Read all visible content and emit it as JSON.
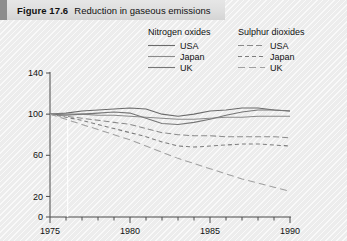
{
  "figure": {
    "number": "Figure 17.6",
    "title": "Reduction in gaseous emissions"
  },
  "legend": {
    "groups": [
      {
        "heading": "Nitrogen oxides",
        "style": "solid",
        "entries": [
          {
            "label": "USA",
            "dash": "none"
          },
          {
            "label": "Japan",
            "dash": "none"
          },
          {
            "label": "UK",
            "dash": "none"
          }
        ]
      },
      {
        "heading": "Sulphur dioxides",
        "style": "dashed",
        "entries": [
          {
            "label": "USA",
            "dash": "6 3"
          },
          {
            "label": "Japan",
            "dash": "4 3"
          },
          {
            "label": "UK",
            "dash": "7 4"
          }
        ]
      }
    ]
  },
  "chart_data": {
    "type": "line",
    "title": "Reduction in gaseous emissions",
    "xlabel": "",
    "ylabel": "",
    "xlim": [
      1975,
      1990
    ],
    "ylim": [
      0,
      140
    ],
    "xticks": [
      1975,
      1980,
      1985,
      1990
    ],
    "xticklabels": [
      "1975",
      "1980",
      "1985",
      "1990"
    ],
    "xminor_step": 1,
    "yticks": [
      0,
      20,
      60,
      100,
      140
    ],
    "yticklabels": [
      "0",
      "20",
      "60",
      "100",
      "140"
    ],
    "grid": false,
    "index_base": "1975 = 100",
    "x": [
      1975,
      1976,
      1977,
      1978,
      1979,
      1980,
      1981,
      1982,
      1983,
      1984,
      1985,
      1986,
      1987,
      1988,
      1989,
      1990
    ],
    "series": [
      {
        "name": "Nitrogen oxides USA",
        "group": "Nitrogen oxides",
        "country": "USA",
        "dash": "none",
        "color": "#6b6b6b",
        "values": [
          100,
          101,
          103,
          104,
          105,
          106,
          105,
          100,
          98,
          100,
          103,
          104,
          106,
          106,
          104,
          103
        ]
      },
      {
        "name": "Nitrogen oxides Japan",
        "group": "Nitrogen oxides",
        "country": "Japan",
        "dash": "none",
        "color": "#8a8a8a",
        "values": [
          100,
          100,
          100,
          99,
          99,
          98,
          97,
          96,
          95,
          95,
          96,
          97,
          97,
          98,
          98,
          98
        ]
      },
      {
        "name": "Nitrogen oxides UK",
        "group": "Nitrogen oxides",
        "country": "UK",
        "dash": "none",
        "color": "#767676",
        "values": [
          100,
          99,
          100,
          101,
          102,
          101,
          96,
          91,
          90,
          92,
          95,
          99,
          102,
          104,
          104,
          103
        ]
      },
      {
        "name": "Sulphur dioxides USA",
        "group": "Sulphur dioxides",
        "country": "USA",
        "dash": "6 3",
        "color": "#8a8a8a",
        "values": [
          100,
          98,
          96,
          94,
          92,
          90,
          86,
          82,
          80,
          79,
          79,
          78,
          78,
          78,
          78,
          77
        ]
      },
      {
        "name": "Sulphur dioxides Japan",
        "group": "Sulphur dioxides",
        "country": "Japan",
        "dash": "4 3",
        "color": "#7d7d7d",
        "values": [
          100,
          97,
          94,
          90,
          86,
          82,
          78,
          73,
          69,
          68,
          69,
          70,
          71,
          71,
          70,
          69
        ]
      },
      {
        "name": "Sulphur dioxides UK",
        "group": "Sulphur dioxides",
        "country": "UK",
        "dash": "7 4",
        "color": "#a0a0a0",
        "values": [
          100,
          95,
          90,
          85,
          80,
          75,
          69,
          63,
          57,
          52,
          47,
          42,
          37,
          33,
          29,
          25
        ]
      }
    ]
  },
  "colors": {
    "background": "#f2f2f2",
    "titlebar": "#dedede",
    "titlebar_tab": "#8d8d8d",
    "axis": "#4a4a4a",
    "text": "#111111"
  }
}
